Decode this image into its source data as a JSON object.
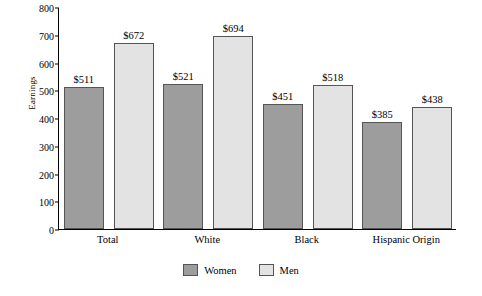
{
  "chart_data": {
    "type": "bar",
    "title": "",
    "xlabel": "",
    "ylabel": "Earnings",
    "ylim": [
      0,
      800
    ],
    "yticks": [
      0,
      100,
      200,
      300,
      400,
      500,
      600,
      700,
      800
    ],
    "grid": false,
    "legend_position": "bottom",
    "categories": [
      "Total",
      "White",
      "Black",
      "Hispanic Origin"
    ],
    "series": [
      {
        "name": "Women",
        "color": "#9d9d9d",
        "values": [
          511,
          521,
          451,
          385
        ],
        "labels": [
          "$511",
          "$521",
          "$451",
          "$385"
        ]
      },
      {
        "name": "Men",
        "color": "#e3e3e3",
        "values": [
          672,
          694,
          518,
          438
        ],
        "labels": [
          "$672",
          "$694",
          "$518",
          "$438"
        ]
      }
    ]
  }
}
